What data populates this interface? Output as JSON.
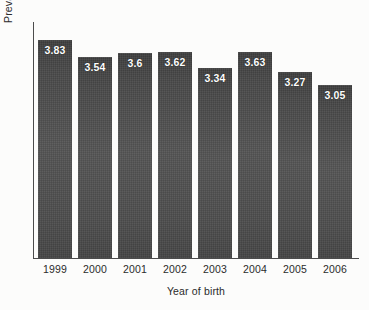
{
  "chart_data": {
    "type": "bar",
    "title": "",
    "subtitle": "",
    "xlabel": "Year of birth",
    "ylabel": "Prevalence per 10,000 live births",
    "categories": [
      "1999",
      "2000",
      "2001",
      "2002",
      "2003",
      "2004",
      "2005",
      "2006"
    ],
    "values": [
      3.83,
      3.54,
      3.6,
      3.62,
      3.34,
      3.63,
      3.27,
      3.05
    ],
    "value_labels": [
      "3.83",
      "3.54",
      "3.6",
      "3.62",
      "3.34",
      "3.63",
      "3.27",
      "3.05"
    ],
    "series": [
      {
        "name": "Prevalence per 10,000 live births",
        "values": [
          3.83,
          3.54,
          3.6,
          3.62,
          3.34,
          3.63,
          3.27,
          3.05
        ]
      }
    ],
    "ylim": [
      0,
      4.15
    ],
    "yticks": [],
    "ytick_labels": [],
    "grid": false,
    "legend": false,
    "legend_position": "none",
    "annotations": [],
    "bar_color": "#4d4d4d",
    "value_label_color": "#ffffff",
    "axis_color": "#4c4c4c",
    "background_color": "#fcfcfb"
  }
}
